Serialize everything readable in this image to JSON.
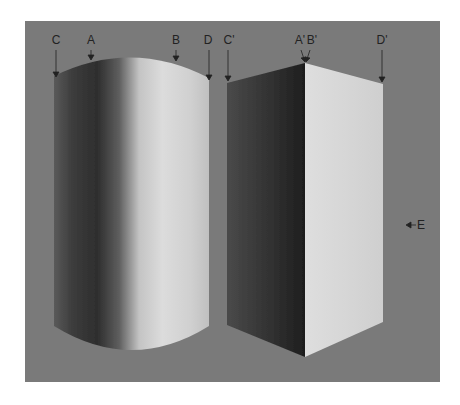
{
  "figure": {
    "background_color": "#7a7a7a",
    "page_color": "#ffffff",
    "shapes": [
      {
        "name": "cylinder",
        "type": "shaded-cylinder"
      },
      {
        "name": "box",
        "type": "shaded-rectangular-prism"
      }
    ],
    "labels": [
      {
        "id": "C",
        "text": "C",
        "x": 56,
        "y": 35
      },
      {
        "id": "A",
        "text": "A",
        "x": 91,
        "y": 35
      },
      {
        "id": "B",
        "text": "B",
        "x": 176,
        "y": 35
      },
      {
        "id": "D",
        "text": "D",
        "x": 208,
        "y": 35
      },
      {
        "id": "C-prime",
        "text": "C'",
        "x": 228,
        "y": 35
      },
      {
        "id": "A-prime",
        "text": "A'",
        "x": 300,
        "y": 35
      },
      {
        "id": "B-prime",
        "text": "B'",
        "x": 312,
        "y": 35
      },
      {
        "id": "D-prime",
        "text": "D'",
        "x": 382,
        "y": 35
      },
      {
        "id": "E",
        "text": "E",
        "x": 421,
        "y": 219
      }
    ]
  }
}
